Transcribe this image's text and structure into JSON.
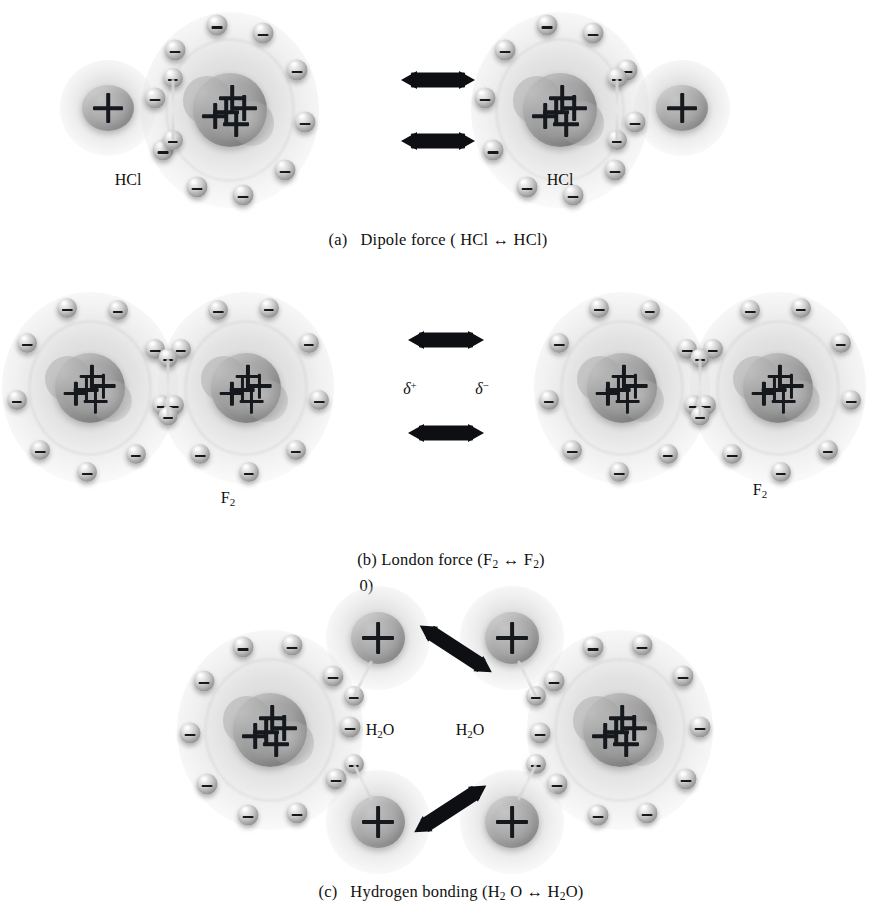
{
  "figure": {
    "background_color": "#ffffff",
    "ink_color": "#15181c",
    "sphere_color": "#cfcfcf",
    "nucleus_color": "#9a9a9a"
  },
  "panels": [
    {
      "id": "a",
      "caption": "(a)   Dipole force ( HCl ↔ HCl)",
      "caption_label": "(a)",
      "force_name": "Dipole force",
      "species": "HCl",
      "molecule_labels": [
        "HCl",
        "HCl"
      ],
      "arrow_count": 2,
      "arrow_direction": "horizontal",
      "molecule_count": 2,
      "description": "Two HCl molecules attracted by permanent dipole forces"
    },
    {
      "id": "b",
      "caption": "(b) London force (F2 ↔ F2)",
      "caption_label": "(b)",
      "caption_stray": "0)",
      "force_name": "London force",
      "species": "F2",
      "species_sub": "2",
      "molecule_labels": [
        "F",
        "F"
      ],
      "partial_charges": [
        "δ",
        "δ"
      ],
      "partial_charge_signs": [
        "+",
        "−"
      ],
      "arrow_count": 2,
      "arrow_direction": "horizontal",
      "molecule_count": 2,
      "description": "Two F2 molecules with instantaneous induced dipoles"
    },
    {
      "id": "c",
      "caption": "(c)   Hydrogen bonding (H2 O ↔ H2O)",
      "caption_label": "(c)",
      "force_name": "Hydrogen bonding",
      "species": "H2O",
      "molecule_labels": [
        "H",
        "H"
      ],
      "molecule_label_sub": "2",
      "molecule_label_tail": "O",
      "arrow_count": 2,
      "arrow_direction": "diagonal",
      "molecule_count": 2,
      "description": "Two water molecules joined by hydrogen bonds"
    }
  ],
  "glyphs": {
    "electron": "−",
    "proton": "+",
    "arrow": "↔",
    "delta": "δ"
  }
}
